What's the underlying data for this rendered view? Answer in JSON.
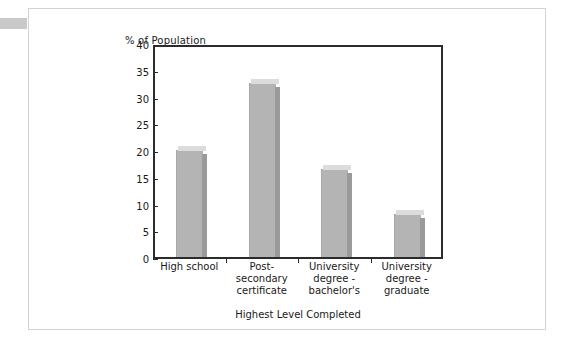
{
  "card": {
    "background_color": "#ffffff",
    "border_color": "#d2d2d2",
    "corner_tab_color": "#c9c9c9"
  },
  "chart_data": {
    "type": "bar",
    "title": "",
    "ylabel": "% of Population",
    "xlabel": "Highest Level Completed",
    "categories": [
      "High school",
      "Post-secondary certificate",
      "University degree - bachelor's",
      "University degree - graduate"
    ],
    "category_lines": [
      [
        "High school"
      ],
      [
        "Post-",
        "secondary",
        "certificate"
      ],
      [
        "University",
        "degree -",
        "bachelor's"
      ],
      [
        "University",
        "degree -",
        "graduate"
      ]
    ],
    "values": [
      20,
      32.5,
      16.5,
      8
    ],
    "ylim": [
      0,
      40
    ],
    "yticks": [
      0,
      5,
      10,
      15,
      20,
      25,
      30,
      35,
      40
    ],
    "ytick_labels": [
      "0",
      "5",
      "10",
      "15",
      "20",
      "25",
      "30",
      "35",
      "40"
    ],
    "grid": false,
    "legend": "none",
    "bar_style": "3d",
    "bar_front_color": "#b4b4b4",
    "bar_side_color": "#9a9a9a",
    "bar_top_color": "#dcdcdc",
    "axis_color": "#2b2b2b"
  }
}
